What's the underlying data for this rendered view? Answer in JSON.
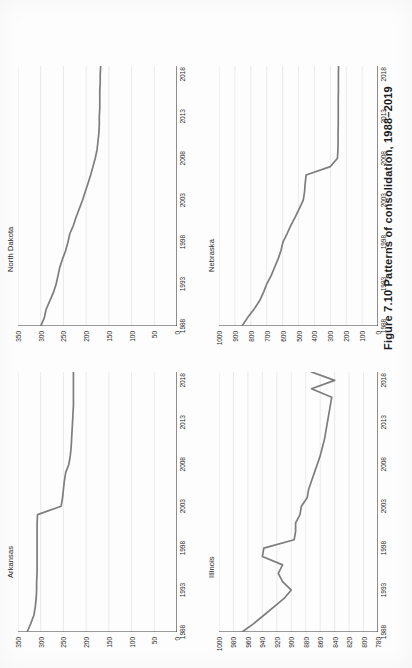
{
  "figure": {
    "number": "Figure 7.10",
    "caption": "Patterns of consolidation, 1988–2019",
    "full_caption": "Figure 7.10  Patterns of consolidation, 1988–2019"
  },
  "style": {
    "line_color": "#7d7d7d",
    "gridline_color": "#c9c9c9",
    "axis_color": "#3a3a3a",
    "page_background": "#fdfdfd",
    "text_color": "#1f1f1f"
  },
  "chart_data": [
    {
      "id": "arkansas",
      "type": "line",
      "title": "Arkansas",
      "xlabel": "",
      "ylabel": "",
      "xlim": [
        1988,
        2019
      ],
      "ylim": [
        0,
        350
      ],
      "xticks": [
        1988,
        1993,
        1998,
        2003,
        2008,
        2013,
        2018
      ],
      "yticks": [
        0,
        50,
        100,
        150,
        200,
        250,
        300,
        350
      ],
      "grid": "horizontal",
      "legend": "none",
      "x": [
        1988,
        1989,
        1990,
        1991,
        1992,
        1993,
        1994,
        1995,
        1996,
        1997,
        1998,
        1999,
        2000,
        2001,
        2002,
        2003,
        2004,
        2005,
        2006,
        2007,
        2008,
        2009,
        2010,
        2011,
        2012,
        2013,
        2014,
        2015,
        2016,
        2017,
        2018,
        2019
      ],
      "values": [
        330,
        322,
        315,
        312,
        310,
        309,
        309,
        308,
        308,
        308,
        308,
        308,
        308,
        308,
        307,
        255,
        252,
        250,
        248,
        245,
        238,
        235,
        233,
        232,
        231,
        230,
        229,
        228,
        228,
        228,
        228,
        228
      ]
    },
    {
      "id": "north-dakota",
      "type": "line",
      "title": "North Dakota",
      "xlabel": "",
      "ylabel": "",
      "xlim": [
        1988,
        2019
      ],
      "ylim": [
        0,
        350
      ],
      "xticks": [
        1988,
        1993,
        1998,
        2003,
        2008,
        2013,
        2018
      ],
      "yticks": [
        0,
        50,
        100,
        150,
        200,
        250,
        300,
        350
      ],
      "grid": "horizontal",
      "legend": "none",
      "x": [
        1988,
        1989,
        1990,
        1991,
        1992,
        1993,
        1994,
        1995,
        1996,
        1997,
        1998,
        1999,
        2000,
        2001,
        2002,
        2003,
        2004,
        2005,
        2006,
        2007,
        2008,
        2009,
        2010,
        2011,
        2012,
        2013,
        2014,
        2015,
        2016,
        2017,
        2018,
        2019
      ],
      "values": [
        300,
        292,
        288,
        280,
        272,
        266,
        262,
        258,
        252,
        245,
        240,
        236,
        228,
        222,
        215,
        208,
        202,
        196,
        190,
        185,
        180,
        176,
        174,
        172,
        171,
        171,
        170,
        170,
        170,
        169,
        169,
        168
      ]
    },
    {
      "id": "illinois",
      "type": "line",
      "title": "Illinois",
      "xlabel": "",
      "ylabel": "",
      "xlim": [
        1988,
        2019
      ],
      "ylim": [
        780,
        1000
      ],
      "xticks": [
        1988,
        1993,
        1998,
        2003,
        2008,
        2013,
        2018
      ],
      "yticks": [
        780,
        800,
        820,
        840,
        860,
        880,
        900,
        920,
        940,
        960,
        980,
        1000
      ],
      "grid": "horizontal",
      "legend": "none",
      "x": [
        1988,
        1989,
        1990,
        1991,
        1992,
        1993,
        1994,
        1995,
        1996,
        1997,
        1998,
        1999,
        2000,
        2001,
        2002,
        2003,
        2004,
        2005,
        2006,
        2007,
        2008,
        2009,
        2010,
        2011,
        2012,
        2013,
        2014,
        2015,
        2016,
        2017,
        2018,
        2019
      ],
      "values": [
        968,
        952,
        938,
        924,
        910,
        900,
        912,
        918,
        912,
        940,
        938,
        896,
        894,
        894,
        888,
        886,
        878,
        876,
        872,
        868,
        864,
        860,
        857,
        854,
        852,
        850,
        848,
        846,
        844,
        872,
        840,
        872
      ]
    },
    {
      "id": "nebraska",
      "type": "line",
      "title": "Nebraska",
      "xlabel": "",
      "ylabel": "",
      "xlim": [
        1988,
        2019
      ],
      "ylim": [
        0,
        1000
      ],
      "xticks": [
        1988,
        1993,
        1998,
        2003,
        2008,
        2013,
        2018
      ],
      "yticks": [
        0,
        100,
        200,
        300,
        400,
        500,
        600,
        700,
        800,
        900,
        1000
      ],
      "grid": "horizontal",
      "legend": "none",
      "x": [
        1988,
        1989,
        1990,
        1991,
        1992,
        1993,
        1994,
        1995,
        1996,
        1997,
        1998,
        1999,
        2000,
        2001,
        2002,
        2003,
        2004,
        2005,
        2006,
        2007,
        2008,
        2009,
        2010,
        2011,
        2012,
        2013,
        2014,
        2015,
        2016,
        2017,
        2018,
        2019
      ],
      "values": [
        855,
        820,
        780,
        745,
        720,
        700,
        672,
        650,
        628,
        610,
        598,
        572,
        548,
        520,
        495,
        470,
        462,
        458,
        452,
        300,
        255,
        252,
        251,
        251,
        250,
        250,
        250,
        250,
        249,
        249,
        249,
        248
      ]
    }
  ]
}
